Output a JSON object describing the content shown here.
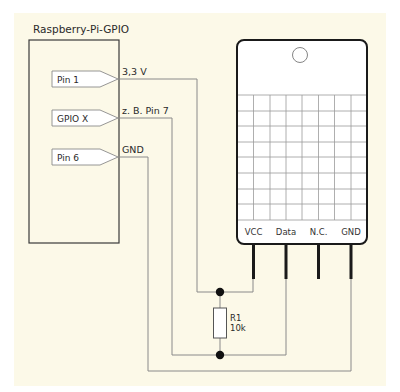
{
  "diagram": {
    "background_color": "#fcf9e8",
    "pi_header": {
      "title": "Raspberry-Pi-GPIO",
      "pins": [
        {
          "label": "Pin 1",
          "signal": "3,3 V"
        },
        {
          "label": "GPIO X",
          "signal": "z. B. Pin 7"
        },
        {
          "label": "Pin 6",
          "signal": "GND"
        }
      ]
    },
    "sensor": {
      "grid_columns": 8,
      "grid_rows": 8,
      "pins": [
        {
          "label": "VCC"
        },
        {
          "label": "Data"
        },
        {
          "label": "N.C."
        },
        {
          "label": "GND"
        }
      ]
    },
    "resistor": {
      "name": "R1",
      "value": "10k"
    },
    "connections": [
      {
        "from": "Pin 1 (3,3 V)",
        "to": "VCC"
      },
      {
        "from": "GPIO X (z. B. Pin 7)",
        "to": "Data"
      },
      {
        "from": "Pin 6 (GND)",
        "to": "GND"
      },
      {
        "from": "VCC",
        "to": "Data",
        "via": "R1 10k"
      }
    ]
  }
}
